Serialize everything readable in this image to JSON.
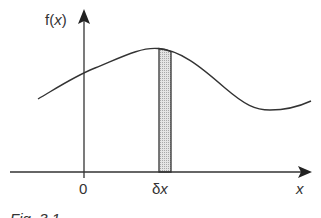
{
  "figure": {
    "y_axis_label_f": "f(",
    "y_axis_label_x": "x",
    "y_axis_label_close": ")",
    "x_axis_label": "x",
    "origin_label": "0",
    "strip_label_delta": "δ",
    "strip_label_x": "x",
    "caption": "Fig. 3.1"
  },
  "colors": {
    "line": "#333333",
    "strip_fill": "#d4d4d4"
  }
}
